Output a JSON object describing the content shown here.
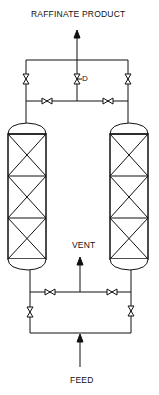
{
  "diagram": {
    "type": "process-flow",
    "labels": {
      "top": "RAFFINATE PRODUCT",
      "vent": "VENT",
      "bottom": "FEED",
      "control_valve_tag": "D"
    },
    "components": {
      "columns": [
        {
          "id": "left-column",
          "beds": 3
        },
        {
          "id": "right-column",
          "beds": 3
        }
      ],
      "valves": [
        "top-left-valve",
        "top-center-control-valve",
        "top-right-valve",
        "upper-crossover-left-valve",
        "upper-crossover-right-valve",
        "lower-crossover-left-valve",
        "lower-crossover-right-valve",
        "bottom-left-valve",
        "bottom-right-valve"
      ],
      "streams": [
        "feed",
        "vent",
        "raffinate-product"
      ]
    },
    "colors": {
      "line": "#111111",
      "background": "#ffffff"
    }
  }
}
